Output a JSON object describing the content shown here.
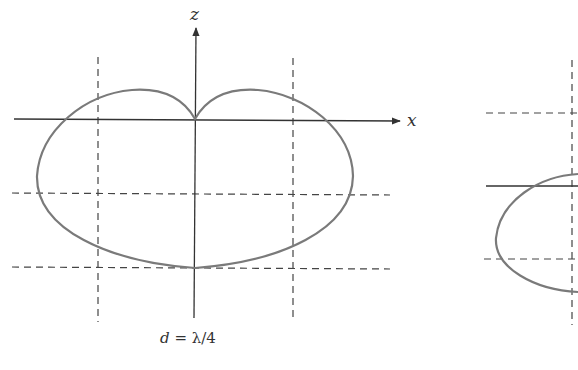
{
  "figure": {
    "left_panel": {
      "axis_labels": {
        "z": "z",
        "x": "x"
      },
      "caption": "d = λ/4",
      "caption_parts": {
        "var": "d",
        "eq": " = ",
        "val": "λ/4"
      },
      "pattern": "cardioid (null along +z)"
    },
    "right_panel": {
      "pattern": "partial lobe (cropped at right edge)"
    },
    "colors": {
      "curve": "#7a7a7a",
      "axis": "#333333",
      "dash": "#444444"
    }
  }
}
